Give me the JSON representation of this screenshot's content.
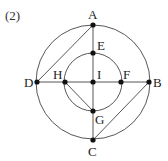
{
  "problem_label": "(2)",
  "colors": {
    "line": "#444444",
    "point": "#111111",
    "text": "#222222",
    "background": "#ffffff"
  },
  "circles": [
    {
      "name": "outer-circle",
      "cx": 93,
      "cy": 82,
      "r": 57
    },
    {
      "name": "inner-circle",
      "cx": 93,
      "cy": 82,
      "r": 29
    }
  ],
  "points": {
    "A": {
      "label": "A",
      "x": 93,
      "y": 25,
      "lx": 88,
      "ly": 19
    },
    "B": {
      "label": "B",
      "x": 149,
      "y": 82,
      "lx": 153,
      "ly": 87
    },
    "C": {
      "label": "C",
      "x": 93,
      "y": 140,
      "lx": 88,
      "ly": 156
    },
    "D": {
      "label": "D",
      "x": 37,
      "y": 82,
      "lx": 24,
      "ly": 87
    },
    "E": {
      "label": "E",
      "x": 93,
      "y": 53,
      "lx": 97,
      "ly": 50
    },
    "F": {
      "label": "F",
      "x": 121,
      "y": 82,
      "lx": 123,
      "ly": 79
    },
    "G": {
      "label": "G",
      "x": 93,
      "y": 111,
      "lx": 95,
      "ly": 124
    },
    "H": {
      "label": "H",
      "x": 65,
      "y": 82,
      "lx": 53,
      "ly": 79
    },
    "I": {
      "label": "I",
      "x": 93,
      "y": 82,
      "lx": 97,
      "ly": 79
    }
  },
  "segments": [
    [
      "A",
      "C"
    ],
    [
      "D",
      "B"
    ],
    [
      "A",
      "D"
    ],
    [
      "B",
      "C"
    ],
    [
      "H",
      "G"
    ]
  ]
}
